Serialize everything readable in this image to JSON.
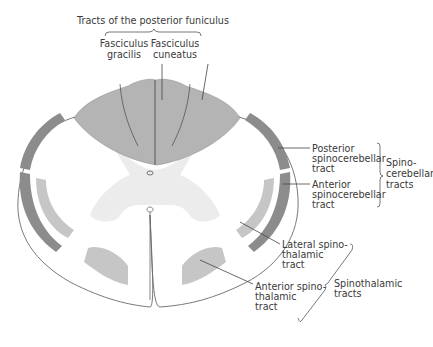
{
  "title": "Tracts of the posterior funiculus",
  "labels": {
    "fasciculus_gracilis": [
      "Fasciculus",
      "gracilis"
    ],
    "fasciculus_cuneatus": [
      "Fasciculus",
      "cuneatus"
    ],
    "posterior_spinocerebellar": [
      "Posterior",
      "spinocerebellar",
      "tract"
    ],
    "anterior_spinocerebellar": [
      "Anterior",
      "spinocerebellar",
      "tract"
    ],
    "spinocerebellar_group": [
      "Spino-",
      "cerebellar",
      "tracts"
    ],
    "lateral_spinothalamic": [
      "Lateral spino-",
      "thalamic",
      "tract"
    ],
    "anterior_spinothalamic": [
      "Anterior spino-",
      "thalamic",
      "tract"
    ],
    "spinothalamic_group": [
      "Spinothalamic",
      "tracts"
    ]
  },
  "colors": {
    "posterior_funiculus": "#b4b4b4",
    "spinocerebellar": "#8c8c8c",
    "spinothalamic": "#c6c6c6",
    "gray_matter": "#ececec",
    "white_matter": "#ffffff",
    "outline": "#6a6a6a"
  }
}
